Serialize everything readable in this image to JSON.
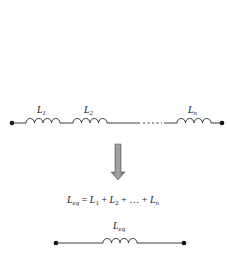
{
  "diagram": {
    "top_circuit": {
      "inductors": [
        {
          "symbol": "L",
          "subscript": "1"
        },
        {
          "symbol": "L",
          "subscript": "2"
        },
        {
          "symbol": "L",
          "subscript": "n"
        }
      ],
      "ellipsis": "....."
    },
    "arrow": {
      "direction": "down",
      "color": "#8a8a8a"
    },
    "equation": {
      "lhs_symbol": "L",
      "lhs_subscript": "eq",
      "equals": " = ",
      "t1": "L",
      "t1_sub": "1",
      "plus1": " + ",
      "t2": "L",
      "t2_sub": "2",
      "plus2": " + … + ",
      "tn": "L",
      "tn_sub": "n"
    },
    "bottom_circuit": {
      "inductor": {
        "symbol": "L",
        "subscript": "eq"
      }
    },
    "colors": {
      "wire": "#3a3a3a",
      "terminal": "#111111",
      "arrow_fill": "#8a8a8a",
      "arrow_stroke": "#555555"
    }
  }
}
